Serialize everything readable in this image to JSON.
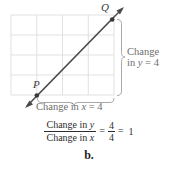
{
  "figure": {
    "part_label": "b.",
    "grid": {
      "columns": 4,
      "rows": 4,
      "line_color": "#dcdcdc",
      "left": 11,
      "top": 15,
      "right": 114,
      "bottom": 95
    },
    "line": {
      "color": "#4a4a4a",
      "from_point": "P",
      "to_point": "Q",
      "slope": 1,
      "arrow_both_ends": true
    },
    "points": [
      {
        "name": "P",
        "label": "P",
        "x": 1,
        "y": 1
      },
      {
        "name": "Q",
        "label": "Q",
        "x": 5,
        "y": 5
      }
    ],
    "annotations": {
      "vertical_brace": {
        "line1": "Change",
        "line2_prefix": "in ",
        "line2_var": "y",
        "line2_suffix": " = 4",
        "full_text": "Change in y = 4",
        "value": 4
      },
      "horizontal_brace": {
        "prefix": "Change in ",
        "var": "x",
        "suffix": " = 4",
        "full_text": "Change in x = 4",
        "value": 4
      },
      "brace_color": "#9a9a9a",
      "text_color": "#6e6e6e"
    },
    "equation": {
      "numerator_prefix": "Change in ",
      "numerator_var": "y",
      "denominator_prefix": "Change in ",
      "denominator_var": "x",
      "equals_1": "=",
      "fraction_numerator": "4",
      "fraction_denominator": "4",
      "equals_2": "=",
      "result": "1",
      "full_text": "Change in y / Change in x = 4/4 = 1"
    }
  }
}
